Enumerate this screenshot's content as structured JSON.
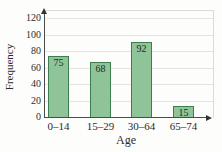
{
  "chart_data": {
    "type": "bar",
    "title": "",
    "xlabel": "Age",
    "ylabel": "Frequency",
    "categories": [
      "0–14",
      "15–29",
      "30–64",
      "65–74"
    ],
    "values": [
      75,
      68,
      92,
      15
    ],
    "bar_labels": [
      "75",
      "68",
      "92",
      "15"
    ],
    "yticks": [
      0,
      20,
      40,
      60,
      80,
      100,
      120
    ],
    "ylim": [
      0,
      120
    ],
    "grid": "horizontal-gridlines",
    "legend": "none",
    "axis_arrows": [
      "y-up",
      "x-right"
    ],
    "colors": {
      "bar_fill": "#8fc499",
      "bar_border": "#3e7d4d",
      "gridline": "#e4e4e0",
      "axis": "#4a4a4a",
      "frame": "#ddddd8",
      "text": "#2c2c2c",
      "background": "#fdfdfc"
    }
  }
}
